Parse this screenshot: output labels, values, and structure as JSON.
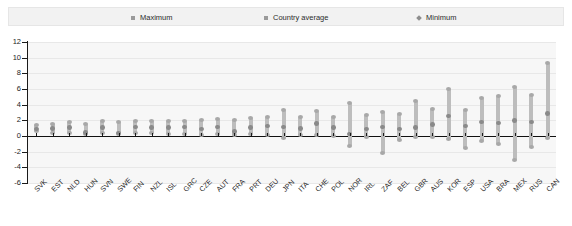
{
  "legend": {
    "items": [
      {
        "label": "Maximum",
        "marker": "square-marker",
        "color": "#9a9a9a"
      },
      {
        "label": "Country average",
        "marker": "square-marker",
        "color": "#9a9a9a"
      },
      {
        "label": "Minimum",
        "marker": "diamond-marker",
        "color": "#8d8d8d"
      }
    ]
  },
  "chart_data": {
    "type": "bar",
    "title": "",
    "subtitle": "",
    "xlabel": "",
    "ylabel": "",
    "ylim": [
      -6,
      12
    ],
    "ytick_step": 2,
    "yticks": [
      -6,
      -4,
      -2,
      0,
      2,
      4,
      6,
      8,
      10,
      12
    ],
    "ytick_labels": [
      "-6",
      "-4",
      "-2",
      "0",
      "2",
      "4",
      "6",
      "8",
      "10",
      "12"
    ],
    "grid": true,
    "legend_position": "top",
    "zero_line": 0,
    "categories": [
      "SVK",
      "EST",
      "NLD",
      "HUN",
      "SVN",
      "SWE",
      "FIN",
      "NZL",
      "ISL",
      "GRC",
      "CZE",
      "AUT",
      "FRA",
      "PRT",
      "DEU",
      "JPN",
      "ITA",
      "CHE",
      "POL",
      "NOR",
      "IRL",
      "ZAF",
      "BEL",
      "GBR",
      "AUS",
      "KOR",
      "ESP",
      "USA",
      "BRA",
      "MEX",
      "RUS",
      "CAN"
    ],
    "series": [
      {
        "name": "Maximum",
        "values": [
          1.5,
          1.7,
          1.9,
          1.6,
          2.0,
          1.9,
          2.0,
          2.1,
          2.0,
          2.1,
          2.2,
          2.3,
          2.2,
          2.4,
          2.6,
          3.4,
          2.5,
          3.3,
          2.6,
          4.3,
          2.8,
          3.2,
          2.9,
          4.6,
          3.6,
          6.1,
          3.4,
          5.0,
          5.2,
          6.4,
          5.4,
          9.4
        ]
      },
      {
        "name": "Country average",
        "values": [
          0.9,
          1.0,
          1.1,
          0.5,
          1.1,
          0.4,
          1.2,
          1.1,
          1.1,
          1.2,
          0.9,
          1.2,
          0.6,
          1.1,
          1.3,
          1.2,
          1.0,
          1.6,
          1.1,
          0.3,
          0.9,
          1.2,
          0.9,
          1.1,
          1.5,
          2.6,
          1.3,
          1.8,
          1.7,
          2.0,
          1.8,
          2.9
        ]
      },
      {
        "name": "Minimum",
        "values": [
          0.5,
          0.3,
          0.3,
          0.1,
          0.2,
          0.1,
          0.2,
          0.2,
          0.1,
          0.1,
          0.0,
          0.1,
          0.0,
          0.1,
          0.0,
          -0.4,
          0.0,
          0.0,
          -0.1,
          -1.4,
          -0.3,
          -2.3,
          -0.6,
          -0.2,
          -0.3,
          -0.5,
          -1.6,
          -0.8,
          -1.2,
          -3.2,
          -1.5,
          -0.4
        ]
      }
    ]
  }
}
